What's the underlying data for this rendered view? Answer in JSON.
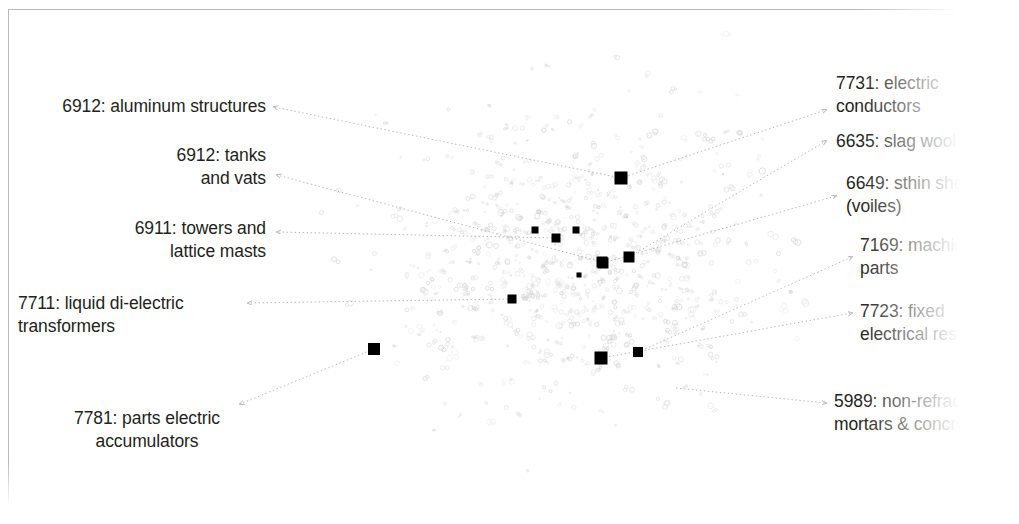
{
  "figure": {
    "kind": "annotated-scatter-map",
    "background_color": "#ffffff",
    "frame_color": "#b9b9bb",
    "point_color": "#c9c9cc",
    "marker_color": "#000000",
    "leader_color": "#a9a9ae",
    "text_color": "#231f20"
  },
  "annotations": [
    {
      "id": "lbl-6912-aluminum",
      "code": "6912",
      "name": "aluminum structures",
      "text": "6912: aluminum structures",
      "side": "left",
      "x": 30,
      "y": 95,
      "width": 236,
      "align": "right",
      "leader": {
        "x1": 274,
        "y1": 107,
        "x2": 621,
        "y2": 178
      },
      "marker": {
        "x": 621,
        "y": 178,
        "size": 13
      }
    },
    {
      "id": "lbl-6912-tanks",
      "code": "6912",
      "name": "tanks and vats",
      "text": "6912: tanks\nand vats",
      "side": "left",
      "x": 120,
      "y": 144,
      "width": 146,
      "align": "right",
      "leader": {
        "x1": 277,
        "y1": 175,
        "x2": 602,
        "y2": 262
      },
      "marker": {
        "x": 602,
        "y": 262,
        "size": 11
      }
    },
    {
      "id": "lbl-6911-towers",
      "code": "6911",
      "name": "towers and lattice masts",
      "text": "6911: towers and\nlattice masts",
      "side": "left",
      "x": 92,
      "y": 217,
      "width": 174,
      "align": "right",
      "leader": {
        "x1": 277,
        "y1": 232,
        "x2": 556,
        "y2": 238
      },
      "marker": {
        "x": 556,
        "y": 238,
        "size": 9
      }
    },
    {
      "id": "lbl-7711-transformers",
      "code": "7711",
      "name": "liquid di-electric transformers",
      "text": "7711: liquid di-electric\ntransformers",
      "side": "left",
      "x": 18,
      "y": 292,
      "width": 222,
      "align": "left",
      "leader": {
        "x1": 248,
        "y1": 303,
        "x2": 512,
        "y2": 299
      },
      "marker": {
        "x": 512,
        "y": 299,
        "size": 9
      }
    },
    {
      "id": "lbl-7781-accumulators",
      "code": "7781",
      "name": "parts electric accumulators",
      "text": "7781: parts electric\naccumulators",
      "side": "left",
      "x": 58,
      "y": 407,
      "width": 178,
      "align": "center",
      "leader": {
        "x1": 240,
        "y1": 404,
        "x2": 374,
        "y2": 349
      },
      "marker": {
        "x": 374,
        "y": 349,
        "size": 12
      }
    },
    {
      "id": "lbl-7731-conductors",
      "code": "7731",
      "name": "electric conductors",
      "text": "7731: electric\nconductors",
      "side": "right",
      "x": 836,
      "y": 72,
      "width": 180,
      "align": "left",
      "leader": {
        "x1": 826,
        "y1": 110,
        "x2": 621,
        "y2": 178
      },
      "marker": {
        "x": 621,
        "y": 178,
        "size": 13
      }
    },
    {
      "id": "lbl-6635-slagwool",
      "code": "6635",
      "name": "slag wool",
      "text": "6635: slag wool",
      "side": "right",
      "x": 836,
      "y": 130,
      "width": 180,
      "align": "left",
      "leader": {
        "x1": 826,
        "y1": 141,
        "x2": 629,
        "y2": 257
      },
      "marker": {
        "x": 629,
        "y": 257,
        "size": 11
      }
    },
    {
      "id": "lbl-6649-sheets",
      "code": "6649",
      "name": "sthin sheets (voiles)",
      "text": "6649: sthin sheets\n(voiles)",
      "side": "right",
      "x": 846,
      "y": 172,
      "width": 172,
      "align": "left",
      "leader": {
        "x1": 836,
        "y1": 196,
        "x2": 603,
        "y2": 263
      },
      "marker": {
        "x": 603,
        "y": 263,
        "size": 11
      }
    },
    {
      "id": "lbl-7169-machineparts",
      "code": "7169",
      "name": "machine parts",
      "text": "7169: machine\nparts",
      "side": "right",
      "x": 860,
      "y": 234,
      "width": 158,
      "align": "left",
      "leader": {
        "x1": 852,
        "y1": 257,
        "x2": 638,
        "y2": 352
      },
      "marker": {
        "x": 638,
        "y": 352,
        "size": 10
      }
    },
    {
      "id": "lbl-7723-resistors",
      "code": "7723",
      "name": "fixed electrical resistors",
      "text": "7723: fixed\nelectrical resistors",
      "side": "right",
      "x": 860,
      "y": 300,
      "width": 158,
      "align": "left",
      "leader": {
        "x1": 852,
        "y1": 313,
        "x2": 601,
        "y2": 358
      },
      "marker": {
        "x": 601,
        "y": 358,
        "size": 13
      }
    },
    {
      "id": "lbl-5989-mortars",
      "code": "5989",
      "name": "non-refractory mortars & concretes",
      "text": "5989: non-refractory\nmortars & concretes",
      "side": "right",
      "x": 834,
      "y": 390,
      "width": 184,
      "align": "left",
      "leader": {
        "x1": 826,
        "y1": 403,
        "x2": 676,
        "y2": 388
      },
      "marker": null
    }
  ],
  "chart_data": {
    "type": "scatter",
    "title": "",
    "xlabel": "",
    "ylabel": "",
    "grid": false,
    "legend": "none",
    "axes_visible": false,
    "xlim": [
      0,
      1019
    ],
    "ylim": [
      0,
      524
    ],
    "highlighted_points": [
      {
        "label": "6912: aluminum structures / 7731: electric conductors",
        "x": 621,
        "y": 178,
        "size": 13
      },
      {
        "label": "6911: towers and lattice masts",
        "x": 556,
        "y": 238,
        "size": 9
      },
      {
        "label": "unlabeled",
        "x": 535,
        "y": 230,
        "size": 7
      },
      {
        "label": "unlabeled",
        "x": 576,
        "y": 230,
        "size": 7
      },
      {
        "label": "6912: tanks and vats",
        "x": 602,
        "y": 262,
        "size": 11
      },
      {
        "label": "6649: sthin sheets (voiles)",
        "x": 603,
        "y": 263,
        "size": 11
      },
      {
        "label": "6635: slag wool",
        "x": 629,
        "y": 257,
        "size": 11
      },
      {
        "label": "7711: liquid di-electric transformers",
        "x": 512,
        "y": 299,
        "size": 9
      },
      {
        "label": "7781: parts electric accumulators",
        "x": 374,
        "y": 349,
        "size": 12
      },
      {
        "label": "7723: fixed electrical resistors",
        "x": 601,
        "y": 358,
        "size": 13
      },
      {
        "label": "7169: machine parts",
        "x": 638,
        "y": 352,
        "size": 10
      },
      {
        "label": "unlabeled",
        "x": 579,
        "y": 275,
        "size": 5
      }
    ],
    "background_cloud": {
      "description": "Several hundred faint light-gray micro-glyph points forming an irregular blob densest near the center, thinning to the top, left and bottom edges",
      "approx_point_count": 620,
      "color": "#c9c9cc",
      "center": [
        580,
        255
      ],
      "spread_x": 150,
      "spread_y": 115
    }
  }
}
